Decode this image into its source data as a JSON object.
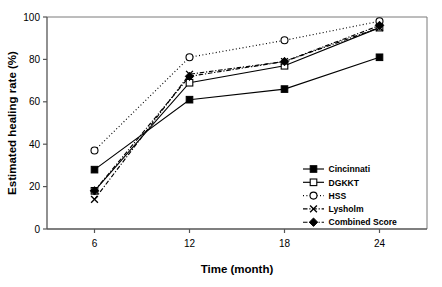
{
  "chart_data": {
    "type": "line",
    "title": "",
    "xlabel": "Time (month)",
    "ylabel": "Estimated healing rate (%)",
    "x": [
      6,
      12,
      18,
      24
    ],
    "xticklabels": [
      "6",
      "12",
      "18",
      "24"
    ],
    "yticklabels": [
      "0",
      "20",
      "40",
      "60",
      "80",
      "100"
    ],
    "yticks": [
      0,
      20,
      40,
      60,
      80,
      100
    ],
    "xlim": [
      3,
      27
    ],
    "ylim": [
      0,
      100
    ],
    "grid": false,
    "legend_position": "lower right inside",
    "series": [
      {
        "name": "Cincinnati",
        "values": [
          28,
          61,
          66,
          81
        ],
        "marker": "filled-square",
        "linestyle": "solid",
        "color": "#000000"
      },
      {
        "name": "DGKKT",
        "values": [
          18,
          69,
          77,
          95
        ],
        "marker": "open-square",
        "linestyle": "solid",
        "color": "#000000"
      },
      {
        "name": "HSS",
        "values": [
          37,
          81,
          89,
          98
        ],
        "marker": "open-circle",
        "linestyle": "dotted",
        "color": "#000000"
      },
      {
        "name": "Lysholm",
        "values": [
          14,
          73,
          79,
          95
        ],
        "marker": "cross-x",
        "linestyle": "dash-dot",
        "color": "#000000"
      },
      {
        "name": "Combined Score",
        "values": [
          18,
          72,
          79,
          96
        ],
        "marker": "filled-diamond",
        "linestyle": "dash-dot",
        "color": "#000000"
      }
    ]
  },
  "axes": {
    "x_axis_label": "Time (month)",
    "y_axis_label": "Estimated healing rate (%)",
    "x_ticks": [
      "6",
      "12",
      "18",
      "24"
    ],
    "y_ticks": [
      "0",
      "20",
      "40",
      "60",
      "80",
      "100"
    ]
  },
  "legend": {
    "entries": [
      {
        "label": "Cincinnati"
      },
      {
        "label": "DGKKT"
      },
      {
        "label": "HSS"
      },
      {
        "label": "Lysholm"
      },
      {
        "label": "Combined Score"
      }
    ]
  },
  "colors": {
    "ink": "#000000",
    "axis": "#595959",
    "background": "#ffffff"
  }
}
